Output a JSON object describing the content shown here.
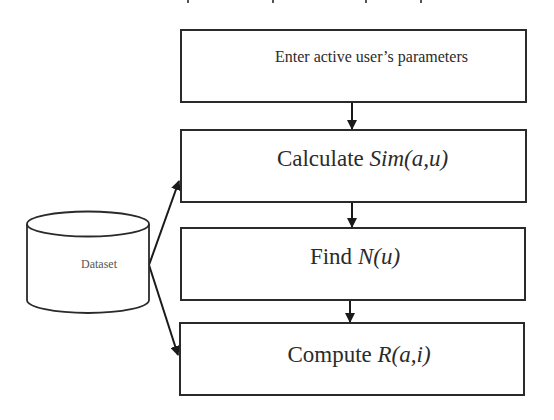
{
  "diagram": {
    "type": "flowchart",
    "steps": [
      {
        "id": "step1",
        "text": "Enter active user’s parameters",
        "math": ""
      },
      {
        "id": "step2",
        "text": "Calculate ",
        "math": "Sim(a,u)"
      },
      {
        "id": "step3",
        "text": "Find ",
        "math": "N(u)"
      },
      {
        "id": "step4",
        "text": "Compute ",
        "math": "R(a,i)"
      }
    ],
    "datastore": {
      "label": "Dataset",
      "shape": "cylinder"
    },
    "edges": [
      {
        "from": "step1",
        "to": "step2"
      },
      {
        "from": "step2",
        "to": "step3"
      },
      {
        "from": "step3",
        "to": "step4"
      },
      {
        "from": "Dataset",
        "to": "step2"
      },
      {
        "from": "Dataset",
        "to": "step4"
      }
    ],
    "colors": {
      "stroke": "#2a2a2a",
      "text": "#2b2b2b",
      "background": "#ffffff"
    }
  }
}
